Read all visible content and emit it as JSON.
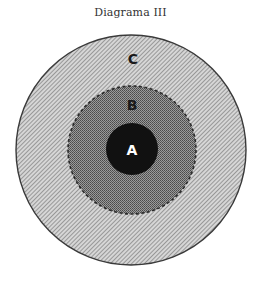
{
  "title": "Diagrama III",
  "circles": [
    {
      "id": "C",
      "label": "C",
      "role": "outer",
      "fill": "#b8b8b8",
      "border": "solid",
      "label_color": "#1a1a1a"
    },
    {
      "id": "B",
      "label": "B",
      "role": "middle",
      "fill": "#8c8c8c",
      "border": "dashed",
      "label_color": "#1a1a1a"
    },
    {
      "id": "A",
      "label": "A",
      "role": "inner",
      "fill": "#111111",
      "border": "none",
      "label_color": "#ffffff"
    }
  ]
}
